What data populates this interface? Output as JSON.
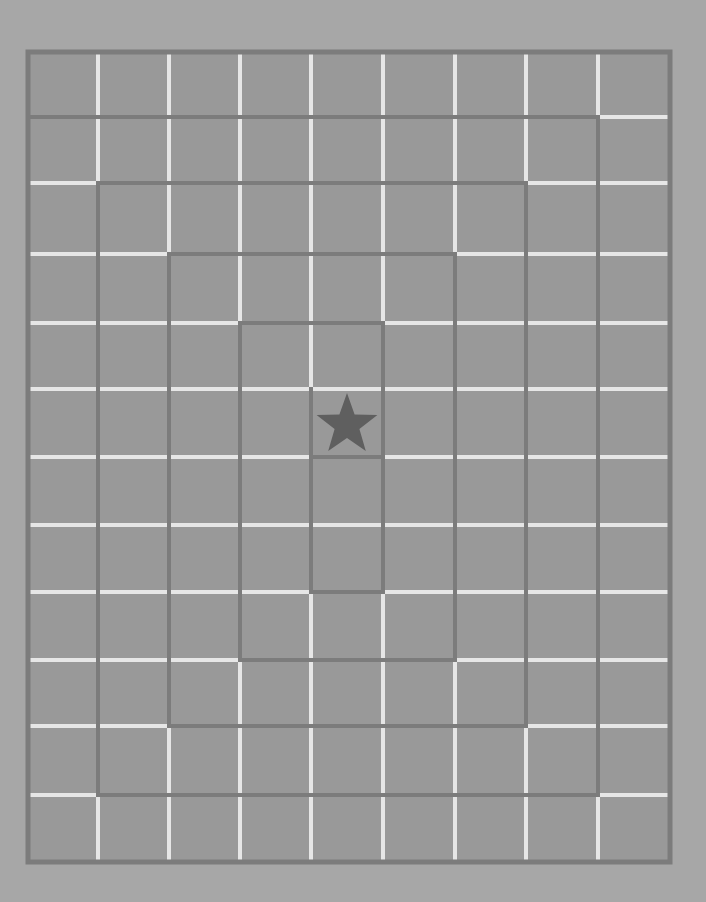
{
  "game": {
    "type": "spiral-maze",
    "columns": 9,
    "rows": 12,
    "grid_x": [
      28,
      98,
      169,
      240,
      311,
      383,
      455,
      526,
      598,
      670
    ],
    "grid_y": [
      52,
      117,
      183,
      254,
      323,
      389,
      457,
      525,
      592,
      660,
      726,
      795,
      862
    ],
    "goal": {
      "icon": "star-icon",
      "col": 4,
      "row": 5
    },
    "colors": {
      "background": "#a7a7a7",
      "cell": "#999999",
      "grid_line": "#e6e6e6",
      "wall": "#7c7c7c",
      "star": "#5f5f5f"
    },
    "walls": [
      [
        28,
        117,
        598,
        117
      ],
      [
        598,
        117,
        598,
        795
      ],
      [
        98,
        795,
        598,
        795
      ],
      [
        98,
        183,
        98,
        795
      ],
      [
        98,
        183,
        526,
        183
      ],
      [
        526,
        183,
        526,
        726
      ],
      [
        169,
        726,
        526,
        726
      ],
      [
        169,
        254,
        169,
        726
      ],
      [
        169,
        254,
        455,
        254
      ],
      [
        455,
        254,
        455,
        660
      ],
      [
        240,
        660,
        455,
        660
      ],
      [
        240,
        323,
        240,
        660
      ],
      [
        240,
        323,
        383,
        323
      ],
      [
        383,
        323,
        383,
        592
      ],
      [
        311,
        592,
        383,
        592
      ],
      [
        311,
        389,
        311,
        592
      ],
      [
        311,
        457,
        383,
        457
      ]
    ]
  }
}
